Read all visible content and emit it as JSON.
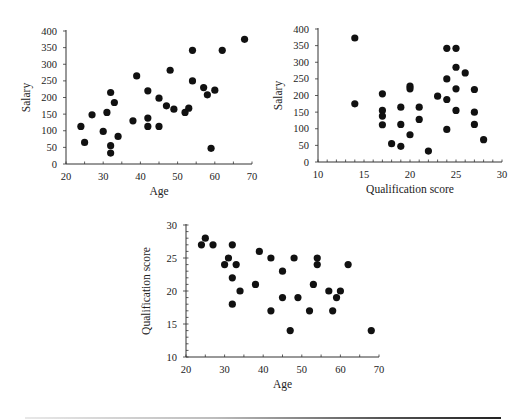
{
  "chart_data": [
    {
      "type": "scatter",
      "title": "",
      "xlabel": "Age",
      "ylabel": "Salary",
      "xlim": [
        20,
        70
      ],
      "ylim": [
        0,
        400
      ],
      "xticks": [
        20,
        30,
        40,
        50,
        60,
        70
      ],
      "yticks": [
        0,
        50,
        100,
        150,
        200,
        250,
        300,
        350,
        400
      ],
      "grid": false,
      "legend": null,
      "points": [
        [
          24,
          113
        ],
        [
          25,
          65
        ],
        [
          27,
          148
        ],
        [
          30,
          98
        ],
        [
          31,
          155
        ],
        [
          32,
          215
        ],
        [
          32,
          55
        ],
        [
          32,
          33
        ],
        [
          33,
          185
        ],
        [
          34,
          83
        ],
        [
          38,
          130
        ],
        [
          39,
          265
        ],
        [
          42,
          220
        ],
        [
          42,
          138
        ],
        [
          42,
          113
        ],
        [
          45,
          198
        ],
        [
          45,
          113
        ],
        [
          47,
          175
        ],
        [
          48,
          282
        ],
        [
          49,
          165
        ],
        [
          52,
          155
        ],
        [
          53,
          168
        ],
        [
          54,
          342
        ],
        [
          54,
          250
        ],
        [
          57,
          230
        ],
        [
          58,
          208
        ],
        [
          59,
          47
        ],
        [
          60,
          222
        ],
        [
          62,
          342
        ],
        [
          68,
          375
        ]
      ]
    },
    {
      "type": "scatter",
      "title": "",
      "xlabel": "Qualification score",
      "ylabel": "Salary",
      "xlim": [
        10,
        30
      ],
      "ylim": [
        0,
        400
      ],
      "xticks": [
        10,
        15,
        20,
        25,
        30
      ],
      "yticks": [
        0,
        50,
        100,
        150,
        200,
        250,
        300,
        350,
        400
      ],
      "grid": false,
      "legend": null,
      "points": [
        [
          14,
          373
        ],
        [
          14,
          175
        ],
        [
          17,
          205
        ],
        [
          17,
          155
        ],
        [
          17,
          138
        ],
        [
          17,
          112
        ],
        [
          18,
          55
        ],
        [
          19,
          165
        ],
        [
          19,
          113
        ],
        [
          19,
          47
        ],
        [
          20,
          228
        ],
        [
          20,
          220
        ],
        [
          20,
          82
        ],
        [
          21,
          165
        ],
        [
          21,
          128
        ],
        [
          22,
          33
        ],
        [
          23,
          198
        ],
        [
          24,
          342
        ],
        [
          24,
          250
        ],
        [
          24,
          188
        ],
        [
          24,
          98
        ],
        [
          25,
          342
        ],
        [
          25,
          285
        ],
        [
          25,
          220
        ],
        [
          25,
          155
        ],
        [
          26,
          268
        ],
        [
          27,
          218
        ],
        [
          27,
          150
        ],
        [
          27,
          113
        ],
        [
          28,
          67
        ]
      ]
    },
    {
      "type": "scatter",
      "title": "",
      "xlabel": "Age",
      "ylabel": "Qualification score",
      "xlim": [
        20,
        70
      ],
      "ylim": [
        10,
        30
      ],
      "xticks": [
        20,
        30,
        40,
        50,
        60,
        70
      ],
      "yticks": [
        10,
        15,
        20,
        25,
        30
      ],
      "grid": false,
      "legend": null,
      "points": [
        [
          24,
          27
        ],
        [
          25,
          28
        ],
        [
          27,
          27
        ],
        [
          30,
          24
        ],
        [
          31,
          25
        ],
        [
          32,
          27
        ],
        [
          32,
          22
        ],
        [
          32,
          18
        ],
        [
          33,
          24
        ],
        [
          34,
          20
        ],
        [
          38,
          21
        ],
        [
          39,
          26
        ],
        [
          42,
          25
        ],
        [
          42,
          17
        ],
        [
          45,
          23
        ],
        [
          45,
          19
        ],
        [
          47,
          14
        ],
        [
          48,
          25
        ],
        [
          49,
          19
        ],
        [
          52,
          17
        ],
        [
          53,
          21
        ],
        [
          54,
          25
        ],
        [
          54,
          24
        ],
        [
          57,
          20
        ],
        [
          58,
          17
        ],
        [
          59,
          19
        ],
        [
          60,
          20
        ],
        [
          62,
          24
        ],
        [
          68,
          14
        ]
      ]
    }
  ],
  "layout": {
    "charts": [
      {
        "x0": 66,
        "x1": 252,
        "y0": 164,
        "y1": 31,
        "minor_x": 5,
        "minor_y": 0
      },
      {
        "x0": 318,
        "x1": 502,
        "y0": 162,
        "y1": 29,
        "minor_x": 1,
        "minor_y": 0
      },
      {
        "x0": 186,
        "x1": 379,
        "y0": 357,
        "y1": 225,
        "minor_x": 5,
        "minor_y": 1
      }
    ],
    "marker_color": "#111111",
    "axis_color": "#333333"
  }
}
